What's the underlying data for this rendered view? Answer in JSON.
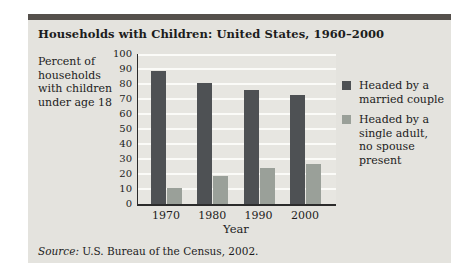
{
  "figure": {
    "y_axis_note": "Percent of\nhouseholds\nwith children\nunder age 18",
    "source_prefix": "Source: ",
    "source_text": "U.S. Bureau of the Census, 2002."
  },
  "chart_data": {
    "type": "bar",
    "title": "Households with Children: United States, 1960–2000",
    "categories": [
      "1970",
      "1980",
      "1990",
      "2000"
    ],
    "series": [
      {
        "name": "Headed by a married couple",
        "values": [
          89,
          81,
          76,
          73
        ],
        "color": "#4e5154"
      },
      {
        "name": "Headed by a single adult, no spouse present",
        "values": [
          11,
          19,
          24,
          27
        ],
        "color": "#9aa099"
      }
    ],
    "legend_labels": [
      "Headed by a\nmarried couple",
      "Headed by a\nsingle adult,\nno spouse\npresent"
    ],
    "xlabel": "Year",
    "ylabel": "Percent of households with children under age 18",
    "ylim": [
      0,
      100
    ],
    "ytick_step": 10,
    "grid": "horizontal-white",
    "legend_position": "right"
  },
  "colors": {
    "panel_bg": "#e4e3de",
    "top_band": "#55504c",
    "gridline": "#fbfbf8",
    "bar_dark": "#4e5154",
    "bar_light": "#9aa099"
  }
}
